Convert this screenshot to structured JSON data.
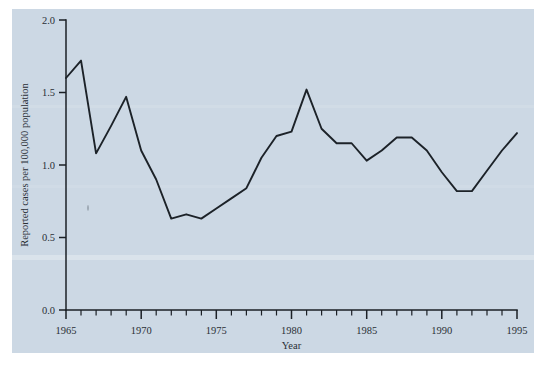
{
  "figure": {
    "background_color": "#ffffff",
    "panel_color": "#ccd8e4",
    "line_color": "#1c2228",
    "axis_color": "#1b2026"
  },
  "chart_data": {
    "type": "line",
    "title": "",
    "subtitle": "",
    "xlabel": "Year",
    "ylabel": "Reported cases per 100,000 population",
    "xlim": [
      1965,
      1995
    ],
    "ylim": [
      0.0,
      2.0
    ],
    "grid": false,
    "legend": null,
    "x_major_ticks": [
      1965,
      1970,
      1975,
      1980,
      1985,
      1990,
      1995
    ],
    "x_major_tick_labels": [
      "1965",
      "1970",
      "1975",
      "1980",
      "1985",
      "1990",
      "1995"
    ],
    "x_minor_tick_interval": 1,
    "y_major_ticks": [
      0.0,
      0.5,
      1.0,
      1.5,
      2.0
    ],
    "y_major_tick_labels": [
      "0.0",
      "0.5",
      "1.0",
      "1.5",
      "2.0"
    ],
    "x": [
      1965,
      1966,
      1967,
      1968,
      1969,
      1970,
      1971,
      1972,
      1973,
      1974,
      1975,
      1976,
      1977,
      1978,
      1979,
      1980,
      1981,
      1982,
      1983,
      1984,
      1985,
      1986,
      1987,
      1988,
      1989,
      1990,
      1991,
      1992,
      1993,
      1994,
      1995
    ],
    "values": [
      1.6,
      1.72,
      1.08,
      1.27,
      1.47,
      1.1,
      0.9,
      0.63,
      0.66,
      0.63,
      0.7,
      0.77,
      0.84,
      1.05,
      1.2,
      1.23,
      1.52,
      1.25,
      1.15,
      1.15,
      1.03,
      1.1,
      1.19,
      1.19,
      1.1,
      0.95,
      0.82,
      0.82,
      0.96,
      1.1,
      1.22
    ],
    "series": [
      {
        "name": "Reported cases per 100,000 population",
        "values": [
          1.6,
          1.72,
          1.08,
          1.27,
          1.47,
          1.1,
          0.9,
          0.63,
          0.66,
          0.63,
          0.7,
          0.77,
          0.84,
          1.05,
          1.2,
          1.23,
          1.52,
          1.25,
          1.15,
          1.15,
          1.03,
          1.1,
          1.19,
          1.19,
          1.1,
          0.95,
          0.82,
          0.82,
          0.96,
          1.1,
          1.22
        ]
      }
    ]
  }
}
